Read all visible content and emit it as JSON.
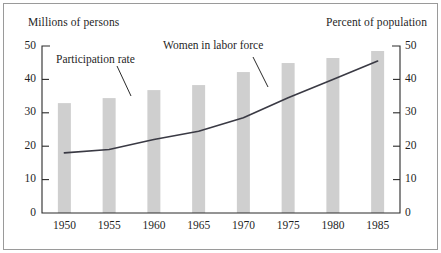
{
  "chart_data": {
    "type": "bar",
    "title": "",
    "subtitle": "",
    "categories": [
      "1950",
      "1955",
      "1960",
      "1965",
      "1970",
      "1975",
      "1980",
      "1985"
    ],
    "x": [
      1950,
      1955,
      1960,
      1965,
      1970,
      1975,
      1980,
      1985
    ],
    "xlabel": "",
    "ylabel": "Millions of persons",
    "ylabel_right": "Percent of population",
    "ylim": [
      0,
      50
    ],
    "ylim_right": [
      0,
      50
    ],
    "yticks": [
      0,
      10,
      20,
      30,
      40,
      50
    ],
    "yticks_right": [
      0,
      10,
      20,
      30,
      40,
      50
    ],
    "grid": false,
    "legend": "annotations-inline",
    "series": [
      {
        "name": "Women in labor force",
        "type": "bar",
        "axis": "left",
        "unit": "millions of persons",
        "color": "#cfcfcf",
        "values": [
          32.9,
          34.4,
          36.8,
          38.3,
          42.2,
          44.9,
          46.4,
          48.5
        ]
      },
      {
        "name": "Participation rate",
        "type": "line",
        "axis": "right",
        "unit": "percent of population",
        "color": "#3a3a44",
        "values": [
          18.0,
          19.0,
          22.0,
          24.5,
          28.5,
          34.5,
          40.0,
          45.5
        ]
      }
    ],
    "annotations": [
      {
        "text": "Participation rate",
        "target_series": "Participation rate"
      },
      {
        "text": "Women in labor force",
        "target_series": "Women in labor force"
      }
    ]
  },
  "axes": {
    "left_title": "Millions of persons",
    "right_title": "Percent of population",
    "left_ticks": [
      "50",
      "40",
      "30",
      "20",
      "10",
      "0"
    ],
    "right_ticks": [
      "50",
      "40",
      "30",
      "20",
      "10",
      "0"
    ],
    "x_ticks": [
      "1950",
      "1955",
      "1960",
      "1965",
      "1970",
      "1975",
      "1980",
      "1985"
    ]
  },
  "annotations": {
    "participation_rate": "Participation rate",
    "women_in_labor_force": "Women in labor force"
  },
  "colors": {
    "bar_fill": "#cfcfcf",
    "line_stroke": "#3a3a44",
    "axis_stroke": "#2a2a2a",
    "frame_stroke": "#9a9a9a",
    "background": "#ffffff"
  }
}
